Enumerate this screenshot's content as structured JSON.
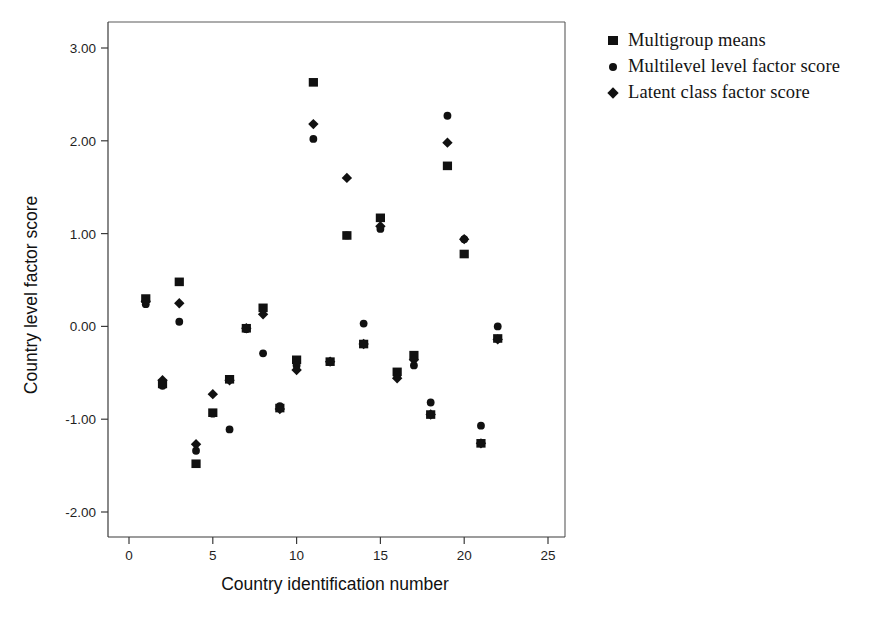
{
  "chart_data": {
    "type": "scatter",
    "title": "",
    "xlabel": "Country identification number",
    "ylabel": "Country level factor score",
    "xlim": [
      -1.5,
      26.5
    ],
    "ylim": [
      -2.55,
      3.35
    ],
    "xticks": [
      "0",
      "5",
      "10",
      "15",
      "20",
      "25"
    ],
    "xtick_values": [
      0,
      5,
      10,
      15,
      20,
      25
    ],
    "yticks": [
      "3.00",
      "2.00",
      "1.00",
      "0.00",
      "-1.00",
      "-2.00"
    ],
    "ytick_values": [
      3,
      2,
      1,
      0,
      -1,
      -2
    ],
    "grid": false,
    "legend_position": "right",
    "series": [
      {
        "name": "Multigroup means",
        "marker": "square",
        "color": "#111111",
        "x": [
          1,
          2,
          3,
          4,
          5,
          6,
          7,
          8,
          9,
          10,
          11,
          12,
          13,
          14,
          15,
          16,
          17,
          18,
          19,
          20,
          21,
          22
        ],
        "y": [
          0.3,
          -0.62,
          0.48,
          -1.48,
          -0.93,
          -0.57,
          -0.02,
          0.2,
          -0.88,
          -0.36,
          2.63,
          -0.38,
          0.98,
          -0.19,
          1.17,
          -0.49,
          -0.31,
          -0.95,
          1.73,
          0.78,
          -1.26,
          -0.13
        ]
      },
      {
        "name": "Multilevel level factor score",
        "marker": "circle",
        "color": "#111111",
        "x": [
          1,
          2,
          3,
          4,
          5,
          6,
          7,
          8,
          9,
          10,
          11,
          12,
          13,
          14,
          15,
          16,
          17,
          18,
          19,
          20,
          21,
          22
        ],
        "y": [
          0.24,
          -0.64,
          0.05,
          -1.34,
          -0.94,
          -1.11,
          -0.03,
          -0.29,
          -0.86,
          -0.42,
          2.02,
          -0.38,
          0.98,
          0.03,
          1.05,
          -0.53,
          -0.42,
          -0.82,
          2.27,
          0.94,
          -1.07,
          0.0
        ]
      },
      {
        "name": "Latent class factor score",
        "marker": "diamond",
        "color": "#111111",
        "x": [
          1,
          2,
          3,
          4,
          5,
          6,
          7,
          8,
          9,
          10,
          11,
          12,
          13,
          14,
          15,
          16,
          17,
          18,
          19,
          20,
          21,
          22
        ],
        "y": [
          0.27,
          -0.58,
          0.25,
          -1.27,
          -0.73,
          -0.58,
          -0.02,
          0.13,
          -0.89,
          -0.47,
          2.18,
          -0.38,
          1.6,
          -0.19,
          1.08,
          -0.56,
          -0.36,
          -0.95,
          1.98,
          0.94,
          -1.26,
          -0.14
        ]
      }
    ]
  },
  "legend": {
    "items": [
      {
        "label": "Multigroup means",
        "glyph": "square-marker-icon"
      },
      {
        "label": "Multilevel level factor score",
        "glyph": "circle-marker-icon"
      },
      {
        "label": "Latent class factor score",
        "glyph": "diamond-marker-icon"
      }
    ]
  }
}
